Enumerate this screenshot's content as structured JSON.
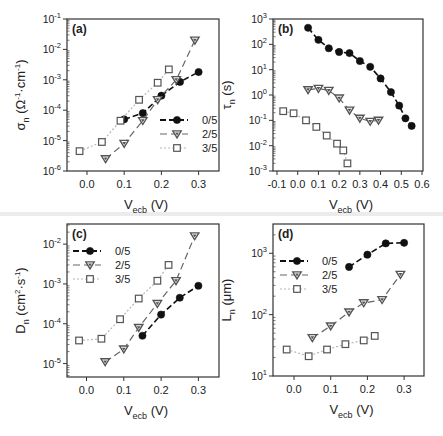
{
  "chart_data": [
    {
      "panel": "(a)",
      "type": "line",
      "xlabel": "V_ecb (V)",
      "ylabel": "σ_n (Ω⁻¹·cm⁻¹)",
      "yscale": "log",
      "xlim": [
        -0.05,
        0.35
      ],
      "ylim": [
        1e-06,
        0.1
      ],
      "xticks": [
        0.0,
        0.1,
        0.2,
        0.3
      ],
      "xtick_labels": [
        "0.0",
        "0.1",
        "0.2",
        "0.3"
      ],
      "yticks_exp": [
        -6,
        -5,
        -4,
        -3,
        -2,
        -1
      ],
      "legend_position": "lower right",
      "series": [
        {
          "name": "0/5",
          "marker": "circle",
          "x": [
            0.1,
            0.15,
            0.2,
            0.25,
            0.3
          ],
          "y": [
            5e-05,
            8e-05,
            0.0003,
            0.00085,
            0.0018
          ]
        },
        {
          "name": "2/5",
          "marker": "triangle-down",
          "x": [
            0.05,
            0.1,
            0.15,
            0.19,
            0.24,
            0.29
          ],
          "y": [
            2.5e-06,
            8e-06,
            4.5e-05,
            0.00022,
            0.001,
            0.02
          ]
        },
        {
          "name": "3/5",
          "marker": "square-open",
          "x": [
            -0.02,
            0.04,
            0.09,
            0.14,
            0.19,
            0.22
          ],
          "y": [
            4.5e-06,
            9e-06,
            4.5e-05,
            0.00022,
            0.0008,
            0.0022
          ]
        }
      ]
    },
    {
      "panel": "(b)",
      "type": "line",
      "xlabel": "V_ecb (V)",
      "ylabel": "τ_n (s)",
      "yscale": "log",
      "xlim": [
        -0.12,
        0.6
      ],
      "ylim": [
        0.001,
        1000.0
      ],
      "xticks": [
        -0.1,
        0.0,
        0.1,
        0.2,
        0.3,
        0.4,
        0.5,
        0.6
      ],
      "xtick_labels": [
        "-0.1",
        "0.0",
        "0.1",
        "0.2",
        "0.3",
        "0.4",
        "0.5",
        "0.6"
      ],
      "yticks_exp": [
        -3,
        -2,
        -1,
        0,
        1,
        2,
        3
      ],
      "series": [
        {
          "name": "0/5",
          "marker": "circle",
          "x": [
            0.05,
            0.1,
            0.15,
            0.2,
            0.25,
            0.3,
            0.35,
            0.4,
            0.45,
            0.49,
            0.52,
            0.55
          ],
          "y": [
            450,
            150,
            70,
            50,
            45,
            22,
            13,
            4.5,
            1.3,
            0.38,
            0.12,
            0.06
          ]
        },
        {
          "name": "2/5",
          "marker": "triangle-down",
          "x": [
            0.05,
            0.1,
            0.15,
            0.2,
            0.25,
            0.3,
            0.35,
            0.39
          ],
          "y": [
            1.6,
            1.8,
            1.5,
            0.75,
            0.25,
            0.12,
            0.09,
            0.1
          ]
        },
        {
          "name": "3/5",
          "marker": "square-open",
          "x": [
            -0.07,
            -0.02,
            0.04,
            0.09,
            0.14,
            0.19,
            0.22,
            0.24
          ],
          "y": [
            0.23,
            0.19,
            0.1,
            0.055,
            0.025,
            0.012,
            0.0065,
            0.002
          ]
        }
      ]
    },
    {
      "panel": "(c)",
      "type": "line",
      "xlabel": "V_ecb (V)",
      "ylabel": "D_n (cm²·s⁻¹)",
      "yscale": "log",
      "xlim": [
        -0.05,
        0.35
      ],
      "ylim": [
        4.6e-06,
        0.032
      ],
      "xticks": [
        0.0,
        0.1,
        0.2,
        0.3
      ],
      "xtick_labels": [
        "0.0",
        "0.1",
        "0.2",
        "0.3"
      ],
      "yticks_exp": [
        -5,
        -4,
        -3,
        -2
      ],
      "legend_position": "upper left",
      "series": [
        {
          "name": "0/5",
          "marker": "circle",
          "x": [
            0.15,
            0.2,
            0.25,
            0.3
          ],
          "y": [
            5e-05,
            0.00017,
            0.00045,
            0.0009
          ]
        },
        {
          "name": "2/5",
          "marker": "triangle-down",
          "x": [
            0.05,
            0.1,
            0.14,
            0.19,
            0.24,
            0.29
          ],
          "y": [
            1.1e-05,
            2.3e-05,
            8e-05,
            0.00032,
            0.0012,
            0.016
          ]
        },
        {
          "name": "3/5",
          "marker": "square-open",
          "x": [
            -0.02,
            0.04,
            0.09,
            0.14,
            0.19,
            0.22
          ],
          "y": [
            3.8e-05,
            4.2e-05,
            0.00013,
            0.00043,
            0.0012,
            0.003
          ]
        }
      ]
    },
    {
      "panel": "(d)",
      "type": "line",
      "xlabel": "V_ecb (V)",
      "ylabel": "L_n (μm)",
      "yscale": "log",
      "xlim": [
        -0.05,
        0.35
      ],
      "ylim": [
        10,
        3000
      ],
      "xticks": [
        0.0,
        0.1,
        0.2,
        0.3
      ],
      "xtick_labels": [
        "0.0",
        "0.1",
        "0.2",
        "0.3"
      ],
      "yticks_exp": [
        1,
        2,
        3
      ],
      "legend_position": "upper left",
      "series": [
        {
          "name": "0/5",
          "marker": "circle",
          "x": [
            0.15,
            0.2,
            0.25,
            0.3
          ],
          "y": [
            600,
            950,
            1450,
            1480
          ]
        },
        {
          "name": "2/5",
          "marker": "triangle-down",
          "x": [
            0.05,
            0.1,
            0.15,
            0.19,
            0.24,
            0.29
          ],
          "y": [
            42,
            65,
            110,
            155,
            175,
            450
          ]
        },
        {
          "name": "3/5",
          "marker": "square-open",
          "x": [
            -0.02,
            0.04,
            0.09,
            0.14,
            0.19,
            0.22
          ],
          "y": [
            27,
            21,
            27,
            33,
            38,
            45
          ]
        }
      ]
    }
  ],
  "panels": [
    {
      "label": "(a)",
      "ylabel_main": "σ",
      "ylabel_sub": "n",
      "ylabel_rest": " (Ω",
      "xlabel_main": "V",
      "xlabel_sub": "ecb",
      "xlabel_rest": " (V)"
    },
    {
      "label": "(b)",
      "ylabel_main": "τ",
      "ylabel_sub": "n",
      "ylabel_rest": " (s)",
      "xlabel_main": "V",
      "xlabel_sub": "ecb",
      "xlabel_rest": " (V)"
    },
    {
      "label": "(c)",
      "ylabel_main": "D",
      "ylabel_sub": "n",
      "ylabel_rest": " (cm",
      "xlabel_main": "V",
      "xlabel_sub": "ecb",
      "xlabel_rest": " (V)"
    },
    {
      "label": "(d)",
      "ylabel_main": "L",
      "ylabel_sub": "n",
      "ylabel_rest": " (μm)",
      "xlabel_main": "V",
      "xlabel_sub": "ecb",
      "xlabel_rest": " (V)"
    }
  ],
  "legend": {
    "entries": [
      "0/5",
      "2/5",
      "3/5"
    ]
  },
  "styles": {
    "series_colors": [
      "#111111",
      "#666666",
      "#b8b8b8"
    ],
    "marker_colors": [
      "#111111",
      "#555555",
      "#555555"
    ],
    "frame_color": "#333333"
  }
}
